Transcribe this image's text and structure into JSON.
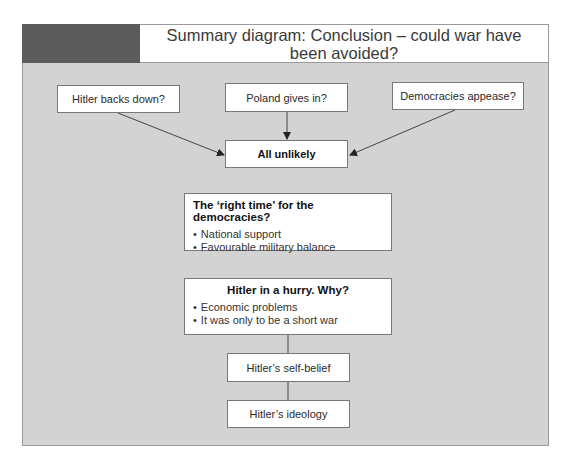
{
  "header": {
    "title": "Summary diagram: Conclusion – could war have been avoided?"
  },
  "top_row": [
    {
      "label": "Hitler backs down?"
    },
    {
      "label": "Poland gives in?"
    },
    {
      "label": "Democracies appease?"
    }
  ],
  "conclusion": {
    "label": "All unlikely"
  },
  "right_time": {
    "title": "The ‘right time’ for the democracies?",
    "points": [
      "National support",
      "Favourable military balance"
    ]
  },
  "hurry": {
    "title": "Hitler in a hurry. Why?",
    "points": [
      "Economic problems",
      "It was only to be a short war"
    ]
  },
  "self_belief": {
    "label": "Hitler’s self-belief"
  },
  "ideology": {
    "label": "Hitler’s ideology"
  },
  "colors": {
    "background": "#d3d3d3",
    "header_block": "#5c5c5c",
    "box": "#ffffff",
    "line": "#444444"
  }
}
